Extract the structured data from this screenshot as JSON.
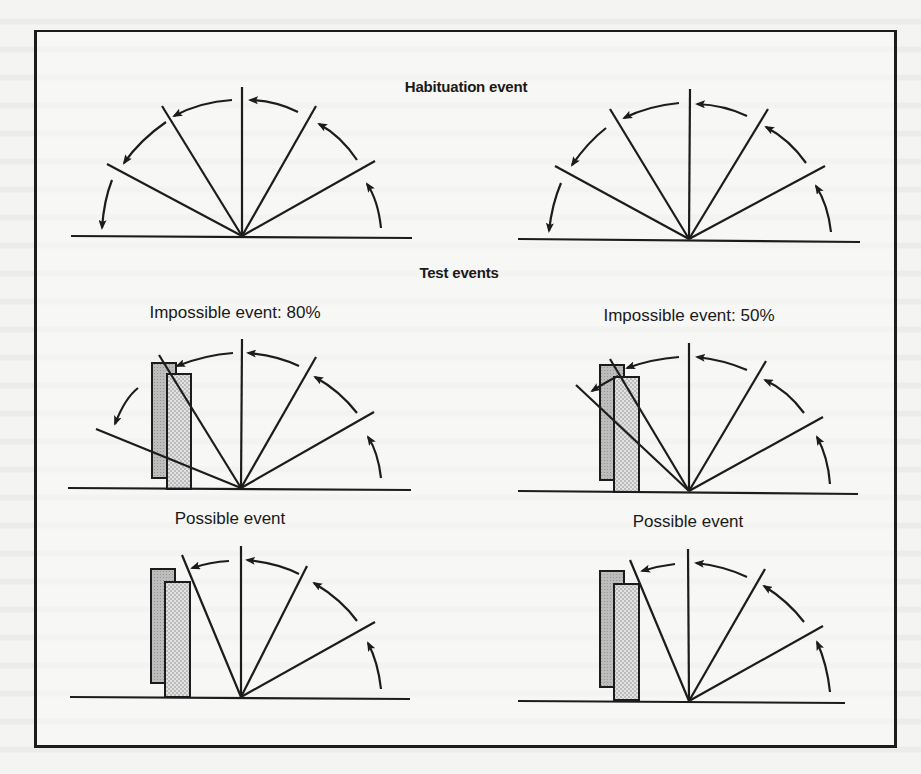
{
  "figure": {
    "title": "Habituation event",
    "section_heading": "Test events",
    "panels": [
      {
        "id": "habituation-left",
        "label": ""
      },
      {
        "id": "habituation-right",
        "label": ""
      },
      {
        "id": "impossible-80",
        "label": "Impossible event: 80%"
      },
      {
        "id": "impossible-50",
        "label": "Impossible event: 50%"
      },
      {
        "id": "possible-left",
        "label": "Possible event"
      },
      {
        "id": "possible-right",
        "label": "Possible event"
      }
    ],
    "colors": {
      "ink": "#1c1c1c",
      "box_back": "#b9b9b9",
      "box_front": "#dcdcdc",
      "paper": "#f4f4f2"
    }
  }
}
